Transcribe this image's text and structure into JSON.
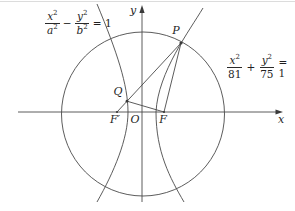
{
  "figure": {
    "colors": {
      "line": "#4a4a4a",
      "text": "#1f1f1f",
      "background": "#ffffff"
    },
    "axes": {
      "x_label": "x",
      "y_label": "y"
    },
    "points": {
      "P": "P",
      "Q": "Q",
      "F_prime": "F′",
      "O": "O",
      "F": "F"
    },
    "equations": {
      "hyperbola": {
        "term1_num": "x",
        "term1_num_exp": "2",
        "term1_den": "a",
        "term1_den_exp": "2",
        "operator": "−",
        "term2_num": "y",
        "term2_num_exp": "2",
        "term2_den": "b",
        "term2_den_exp": "2",
        "rhs": "= 1"
      },
      "ellipse": {
        "term1_num": "x",
        "term1_num_exp": "2",
        "term1_den": "81",
        "operator": "+",
        "term2_num": "y",
        "term2_num_exp": "2",
        "term2_den": "75",
        "rhs": "= 1"
      }
    }
  }
}
